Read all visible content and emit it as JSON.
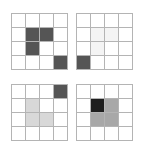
{
  "figure": {
    "layout": "2x2",
    "panel_count": 4,
    "grid_rows": 4,
    "grid_cols": 4,
    "background_color": "#ffffff",
    "grid_line_color": "#b4b4b4",
    "empty_cell_color": "#ffffff"
  },
  "palette": {
    "empty": "#ffffff",
    "very_light": "#f4f4f4",
    "light": "#d8d8d8",
    "medium": "#a8a8a8",
    "dark": "#555555",
    "very_dark": "#1e1e1e"
  },
  "panels": [
    {
      "id": "panel-top-left",
      "name": "top-left",
      "position": {
        "row": 0,
        "col": 0
      },
      "cells": [
        [
          "#ffffff",
          "#ffffff",
          "#ffffff",
          "#ffffff"
        ],
        [
          "#ffffff",
          "#555555",
          "#555555",
          "#ffffff"
        ],
        [
          "#ffffff",
          "#555555",
          "#ffffff",
          "#ffffff"
        ],
        [
          "#ffffff",
          "#ffffff",
          "#ffffff",
          "#555555"
        ]
      ]
    },
    {
      "id": "panel-top-right",
      "name": "top-right",
      "position": {
        "row": 0,
        "col": 1
      },
      "cells": [
        [
          "#ffffff",
          "#ffffff",
          "#ffffff",
          "#ffffff"
        ],
        [
          "#ffffff",
          "#f4f4f4",
          "#f4f4f4",
          "#ffffff"
        ],
        [
          "#ffffff",
          "#f4f4f4",
          "#ffffff",
          "#ffffff"
        ],
        [
          "#555555",
          "#ffffff",
          "#ffffff",
          "#ffffff"
        ]
      ]
    },
    {
      "id": "panel-bottom-left",
      "name": "bottom-left",
      "position": {
        "row": 1,
        "col": 0
      },
      "cells": [
        [
          "#ffffff",
          "#ffffff",
          "#ffffff",
          "#555555"
        ],
        [
          "#ffffff",
          "#d8d8d8",
          "#ffffff",
          "#ffffff"
        ],
        [
          "#ffffff",
          "#d8d8d8",
          "#d8d8d8",
          "#ffffff"
        ],
        [
          "#ffffff",
          "#ffffff",
          "#ffffff",
          "#ffffff"
        ]
      ]
    },
    {
      "id": "panel-bottom-right",
      "name": "bottom-right",
      "position": {
        "row": 1,
        "col": 1
      },
      "cells": [
        [
          "#ffffff",
          "#ffffff",
          "#ffffff",
          "#ffffff"
        ],
        [
          "#ffffff",
          "#1e1e1e",
          "#a8a8a8",
          "#ffffff"
        ],
        [
          "#ffffff",
          "#a8a8a8",
          "#a8a8a8",
          "#ffffff"
        ],
        [
          "#ffffff",
          "#ffffff",
          "#ffffff",
          "#ffffff"
        ]
      ]
    }
  ]
}
